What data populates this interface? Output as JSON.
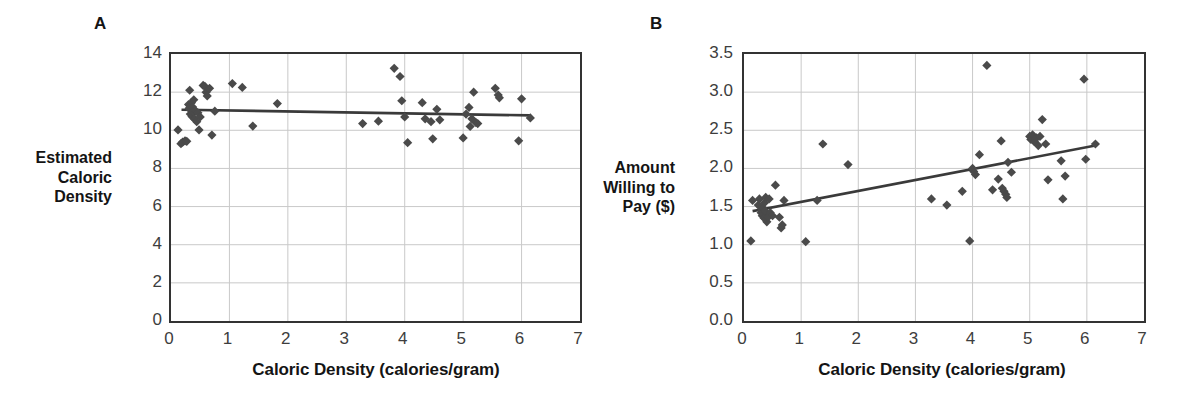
{
  "figure": {
    "background": "#ffffff",
    "marker_color": "#4a4a4a",
    "trendline_color": "#3a3a3a",
    "grid_color": "#c9c9c9",
    "frame_color": "#333333"
  },
  "chart_data": [
    {
      "type": "scatter",
      "panel_label": "A",
      "title": "",
      "xlabel": "Caloric Density (calories/gram)",
      "ylabel": "Estimated\nCaloric\nDensity",
      "ylabel_lines": [
        "Estimated",
        "Caloric",
        "Density"
      ],
      "xlim": [
        0,
        7
      ],
      "ylim": [
        0,
        14
      ],
      "xticks": [
        0,
        1,
        2,
        3,
        4,
        5,
        6,
        7
      ],
      "yticks": [
        0,
        2,
        4,
        6,
        8,
        10,
        12,
        14
      ],
      "xtick_labels": [
        "0",
        "1",
        "2",
        "3",
        "4",
        "5",
        "6",
        "7"
      ],
      "ytick_labels": [
        "0",
        "2",
        "4",
        "6",
        "8",
        "10",
        "12",
        "14"
      ],
      "grid": true,
      "legend": false,
      "marker": "diamond",
      "points": [
        [
          0.12,
          10.02
        ],
        [
          0.17,
          9.3
        ],
        [
          0.2,
          9.38
        ],
        [
          0.24,
          9.45
        ],
        [
          0.27,
          9.42
        ],
        [
          0.3,
          11.35
        ],
        [
          0.31,
          11.15
        ],
        [
          0.32,
          12.1
        ],
        [
          0.33,
          10.85
        ],
        [
          0.34,
          11.05
        ],
        [
          0.35,
          11.45
        ],
        [
          0.36,
          10.72
        ],
        [
          0.37,
          11.22
        ],
        [
          0.38,
          10.95
        ],
        [
          0.39,
          11.6
        ],
        [
          0.4,
          10.6
        ],
        [
          0.42,
          11.02
        ],
        [
          0.44,
          10.45
        ],
        [
          0.46,
          10.92
        ],
        [
          0.48,
          10.02
        ],
        [
          0.5,
          10.7
        ],
        [
          0.55,
          12.35
        ],
        [
          0.58,
          12.3
        ],
        [
          0.6,
          12.0
        ],
        [
          0.62,
          11.8
        ],
        [
          0.66,
          12.2
        ],
        [
          0.7,
          9.75
        ],
        [
          0.75,
          11.0
        ],
        [
          1.05,
          12.45
        ],
        [
          1.22,
          12.25
        ],
        [
          1.4,
          10.22
        ],
        [
          1.82,
          11.4
        ],
        [
          3.28,
          10.35
        ],
        [
          3.55,
          10.48
        ],
        [
          3.82,
          13.25
        ],
        [
          3.92,
          12.82
        ],
        [
          3.95,
          11.55
        ],
        [
          4.0,
          10.7
        ],
        [
          4.05,
          9.35
        ],
        [
          4.3,
          11.45
        ],
        [
          4.35,
          10.6
        ],
        [
          4.45,
          10.45
        ],
        [
          4.48,
          9.55
        ],
        [
          4.55,
          11.1
        ],
        [
          4.6,
          10.55
        ],
        [
          5.0,
          9.6
        ],
        [
          5.05,
          10.85
        ],
        [
          5.1,
          11.2
        ],
        [
          5.12,
          10.2
        ],
        [
          5.15,
          10.6
        ],
        [
          5.18,
          12.0
        ],
        [
          5.22,
          10.4
        ],
        [
          5.25,
          10.35
        ],
        [
          5.55,
          12.2
        ],
        [
          5.6,
          11.85
        ],
        [
          5.62,
          11.7
        ],
        [
          5.95,
          9.45
        ],
        [
          6.0,
          11.65
        ],
        [
          6.15,
          10.65
        ]
      ],
      "trendline": {
        "x": [
          0.18,
          6.15
        ],
        "y": [
          11.08,
          10.78
        ]
      }
    },
    {
      "type": "scatter",
      "panel_label": "B",
      "title": "",
      "xlabel": "Caloric Density (calories/gram)",
      "ylabel": "Amount\nWilling to\nPay ($)",
      "ylabel_lines": [
        "Amount",
        "Willing to",
        "Pay ($)"
      ],
      "xlim": [
        0,
        7
      ],
      "ylim": [
        0.0,
        3.5
      ],
      "xticks": [
        0,
        1,
        2,
        3,
        4,
        5,
        6,
        7
      ],
      "yticks": [
        0.0,
        0.5,
        1.0,
        1.5,
        2.0,
        2.5,
        3.0,
        3.5
      ],
      "xtick_labels": [
        "0",
        "1",
        "2",
        "3",
        "4",
        "5",
        "6",
        "7"
      ],
      "ytick_labels": [
        "0.0",
        "0.5",
        "1.0",
        "1.5",
        "2.0",
        "2.5",
        "3.0",
        "3.5"
      ],
      "grid": true,
      "legend": false,
      "marker": "diamond",
      "points": [
        [
          0.12,
          1.05
        ],
        [
          0.15,
          1.58
        ],
        [
          0.25,
          1.52
        ],
        [
          0.27,
          1.6
        ],
        [
          0.3,
          1.42
        ],
        [
          0.31,
          1.45
        ],
        [
          0.32,
          1.38
        ],
        [
          0.33,
          1.48
        ],
        [
          0.34,
          1.4
        ],
        [
          0.35,
          1.35
        ],
        [
          0.36,
          1.55
        ],
        [
          0.37,
          1.44
        ],
        [
          0.38,
          1.62
        ],
        [
          0.4,
          1.3
        ],
        [
          0.42,
          1.36
        ],
        [
          0.44,
          1.6
        ],
        [
          0.46,
          1.42
        ],
        [
          0.5,
          1.38
        ],
        [
          0.55,
          1.78
        ],
        [
          0.62,
          1.36
        ],
        [
          0.65,
          1.22
        ],
        [
          0.67,
          1.26
        ],
        [
          0.7,
          1.58
        ],
        [
          1.08,
          1.04
        ],
        [
          1.28,
          1.58
        ],
        [
          1.38,
          2.32
        ],
        [
          1.82,
          2.05
        ],
        [
          3.28,
          1.6
        ],
        [
          3.55,
          1.52
        ],
        [
          3.82,
          1.7
        ],
        [
          3.95,
          1.05
        ],
        [
          4.0,
          2.0
        ],
        [
          4.02,
          1.96
        ],
        [
          4.05,
          1.92
        ],
        [
          4.12,
          2.18
        ],
        [
          4.25,
          3.35
        ],
        [
          4.35,
          1.72
        ],
        [
          4.45,
          1.86
        ],
        [
          4.5,
          2.36
        ],
        [
          4.52,
          1.74
        ],
        [
          4.55,
          1.7
        ],
        [
          4.58,
          1.66
        ],
        [
          4.6,
          1.62
        ],
        [
          4.62,
          2.08
        ],
        [
          4.68,
          1.95
        ],
        [
          5.0,
          2.42
        ],
        [
          5.02,
          2.38
        ],
        [
          5.05,
          2.44
        ],
        [
          5.08,
          2.35
        ],
        [
          5.12,
          2.4
        ],
        [
          5.15,
          2.3
        ],
        [
          5.18,
          2.42
        ],
        [
          5.22,
          2.64
        ],
        [
          5.28,
          2.32
        ],
        [
          5.32,
          1.85
        ],
        [
          5.55,
          2.1
        ],
        [
          5.58,
          1.6
        ],
        [
          5.62,
          1.9
        ],
        [
          5.95,
          3.17
        ],
        [
          5.98,
          2.12
        ],
        [
          6.15,
          2.32
        ]
      ],
      "trendline": {
        "x": [
          0.15,
          6.15
        ],
        "y": [
          1.44,
          2.3
        ]
      }
    }
  ]
}
